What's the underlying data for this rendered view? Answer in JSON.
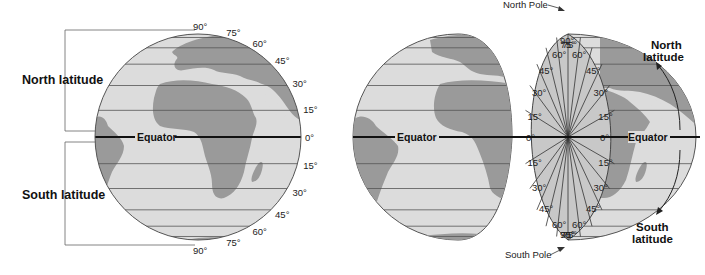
{
  "left_figure": {
    "north_label": "North latitude",
    "south_label": "South latitude",
    "equator_label": "Equator",
    "latitudes": [
      {
        "deg": 90,
        "label": "90°"
      },
      {
        "deg": 75,
        "label": "75°"
      },
      {
        "deg": 60,
        "label": "60°"
      },
      {
        "deg": 45,
        "label": "45°"
      },
      {
        "deg": 30,
        "label": "30°"
      },
      {
        "deg": 15,
        "label": "15°"
      },
      {
        "deg": 0,
        "label": "0°"
      },
      {
        "deg": -15,
        "label": "15°"
      },
      {
        "deg": -30,
        "label": "30°"
      },
      {
        "deg": -45,
        "label": "45°"
      },
      {
        "deg": -60,
        "label": "60°"
      },
      {
        "deg": -75,
        "label": "75°"
      },
      {
        "deg": -90,
        "label": "90°"
      }
    ]
  },
  "right_figure": {
    "north_pole_label": "North Pole",
    "south_pole_label": "South Pole",
    "equator_label": "Equator",
    "north_latitude_label": [
      "North",
      "latitude"
    ],
    "south_latitude_label": [
      "South",
      "latitude"
    ],
    "wedge_angles": [
      {
        "deg": 90,
        "label": "90°"
      },
      {
        "deg": 75,
        "label": "75°"
      },
      {
        "deg": 60,
        "label": "60°"
      },
      {
        "deg": 45,
        "label": "45°"
      },
      {
        "deg": 30,
        "label": "30°"
      },
      {
        "deg": 15,
        "label": "15°"
      },
      {
        "deg": 0,
        "label": "0°"
      },
      {
        "deg": -15,
        "label": "15°"
      },
      {
        "deg": -30,
        "label": "30°"
      },
      {
        "deg": -45,
        "label": "45°"
      },
      {
        "deg": -60,
        "label": "60°"
      },
      {
        "deg": -75,
        "label": "75°"
      },
      {
        "deg": -90,
        "label": "90°"
      }
    ]
  },
  "colors": {
    "ocean": "#dcdcdc",
    "land": "#9a9a9a",
    "wedge": "#c8c8c8",
    "line": "#444444",
    "equator": "#111111"
  }
}
